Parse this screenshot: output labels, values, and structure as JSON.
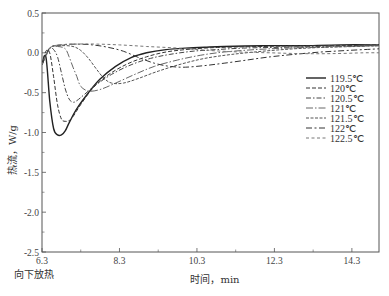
{
  "chart_data": {
    "type": "line",
    "title": "",
    "xlabel": "时间，min",
    "ylabel": "热流，W/g",
    "note": "向下放热",
    "xlim": [
      6.3,
      15.0
    ],
    "ylim": [
      -2.5,
      0.5
    ],
    "xticks": [
      6.3,
      8.3,
      10.3,
      12.3,
      14.3
    ],
    "xtick_labels": [
      "6.3",
      "8.3",
      "10.3",
      "12.3",
      "14.3"
    ],
    "yticks": [
      0.5,
      0.0,
      -0.5,
      -1.0,
      -1.5,
      -2.0,
      -2.5
    ],
    "ytick_labels": [
      "0.5",
      "0.0",
      "-0.5",
      "-1.0",
      "-1.5",
      "-2.0",
      "-2.5"
    ],
    "grid": false,
    "legend_position": "right-middle",
    "series": [
      {
        "name": "119.5℃",
        "style": "solid",
        "color": "#222222",
        "x": [
          6.3,
          6.4,
          6.5,
          6.6,
          6.7,
          6.8,
          6.9,
          7.0,
          7.2,
          7.5,
          7.8,
          8.2,
          8.6,
          9.0,
          9.5,
          10.0,
          10.5,
          11.0,
          12.0,
          13.0,
          14.0,
          15.0
        ],
        "y": [
          -0.15,
          -0.05,
          -0.6,
          -0.95,
          -1.03,
          -1.03,
          -0.98,
          -0.88,
          -0.7,
          -0.5,
          -0.33,
          -0.17,
          -0.06,
          0.0,
          0.04,
          0.06,
          0.07,
          0.08,
          0.09,
          0.09,
          0.1,
          0.1
        ]
      },
      {
        "name": "120℃",
        "style": "dashed",
        "color": "#333333",
        "x": [
          6.3,
          6.4,
          6.5,
          6.6,
          6.7,
          6.8,
          6.9,
          7.0,
          7.1,
          7.3,
          7.6,
          8.0,
          8.5,
          9.0,
          9.5,
          10.0,
          10.5,
          11.0,
          12.0,
          13.0,
          14.0,
          15.0
        ],
        "y": [
          -0.15,
          0.02,
          0.0,
          -0.3,
          -0.65,
          -0.83,
          -0.86,
          -0.85,
          -0.8,
          -0.65,
          -0.45,
          -0.28,
          -0.14,
          -0.05,
          0.01,
          0.04,
          0.06,
          0.07,
          0.08,
          0.09,
          0.09,
          0.1
        ]
      },
      {
        "name": "120.5℃",
        "style": "dash-dot",
        "color": "#444444",
        "x": [
          6.3,
          6.5,
          6.6,
          6.7,
          6.8,
          6.9,
          7.0,
          7.1,
          7.2,
          7.4,
          7.7,
          8.1,
          8.6,
          9.1,
          9.6,
          10.2,
          10.8,
          11.5,
          12.5,
          13.5,
          14.5,
          15.0
        ],
        "y": [
          -0.15,
          0.05,
          0.04,
          -0.05,
          -0.25,
          -0.45,
          -0.58,
          -0.62,
          -0.6,
          -0.52,
          -0.4,
          -0.27,
          -0.15,
          -0.07,
          -0.02,
          0.02,
          0.04,
          0.06,
          0.07,
          0.08,
          0.09,
          0.09
        ]
      },
      {
        "name": "121℃",
        "style": "long-dash-dot",
        "color": "#666666",
        "x": [
          6.3,
          6.5,
          6.7,
          6.9,
          7.0,
          7.1,
          7.2,
          7.3,
          7.5,
          7.8,
          8.2,
          8.7,
          9.2,
          9.8,
          10.4,
          11.0,
          11.8,
          12.6,
          13.4,
          14.2,
          15.0
        ],
        "y": [
          -0.15,
          0.06,
          0.08,
          0.05,
          -0.05,
          -0.18,
          -0.3,
          -0.42,
          -0.48,
          -0.46,
          -0.38,
          -0.27,
          -0.17,
          -0.09,
          -0.03,
          0.01,
          0.04,
          0.06,
          0.07,
          0.08,
          0.09
        ]
      },
      {
        "name": "121.5℃",
        "style": "short-dash",
        "color": "#555555",
        "x": [
          6.3,
          6.5,
          6.8,
          7.1,
          7.3,
          7.5,
          7.7,
          7.9,
          8.1,
          8.4,
          8.8,
          9.3,
          9.9,
          10.5,
          11.2,
          12.0,
          12.8,
          13.6,
          14.4,
          15.0
        ],
        "y": [
          -0.15,
          0.06,
          0.09,
          0.08,
          0.03,
          -0.07,
          -0.2,
          -0.32,
          -0.38,
          -0.38,
          -0.32,
          -0.23,
          -0.14,
          -0.07,
          -0.02,
          0.02,
          0.05,
          0.07,
          0.08,
          0.09
        ]
      },
      {
        "name": "122℃",
        "style": "dash-dot-wide",
        "color": "#333333",
        "x": [
          6.3,
          6.5,
          6.8,
          7.2,
          7.6,
          8.0,
          8.4,
          8.8,
          9.2,
          9.6,
          10.0,
          10.5,
          11.0,
          11.6,
          12.2,
          12.8,
          13.5,
          14.2,
          15.0
        ],
        "y": [
          -0.15,
          0.06,
          0.1,
          0.11,
          0.1,
          0.07,
          0.02,
          -0.06,
          -0.13,
          -0.17,
          -0.18,
          -0.16,
          -0.13,
          -0.09,
          -0.05,
          -0.02,
          0.01,
          0.03,
          0.05
        ]
      },
      {
        "name": "122.5℃",
        "style": "fine-dash",
        "color": "#777777",
        "x": [
          6.3,
          6.5,
          6.8,
          7.2,
          7.7,
          8.3,
          9.0,
          9.8,
          10.6,
          11.4,
          12.2,
          13.0,
          13.8,
          14.6,
          15.0
        ],
        "y": [
          -0.15,
          0.06,
          0.1,
          0.11,
          0.11,
          0.1,
          0.08,
          0.06,
          0.03,
          0.01,
          0.0,
          -0.01,
          -0.01,
          0.0,
          0.0
        ]
      }
    ]
  }
}
